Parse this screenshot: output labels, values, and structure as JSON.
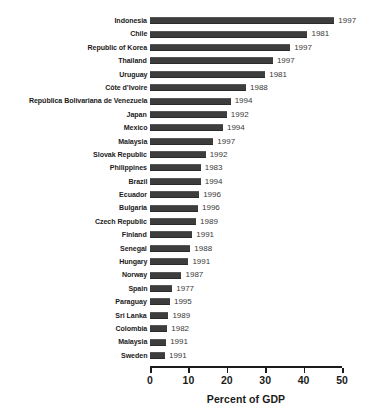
{
  "chart_data": {
    "type": "bar",
    "orientation": "horizontal",
    "title": "",
    "xlabel": "Percent of GDP",
    "ylabel": "",
    "xlim": [
      0,
      50
    ],
    "xticks": [
      0,
      10,
      20,
      30,
      40,
      50
    ],
    "xtick_labels": [
      "0",
      "10",
      "20",
      "30",
      "40",
      "50"
    ],
    "grid": false,
    "legend": null,
    "bar_color": "#3d3d3d",
    "axis_color": "#1b1b1b",
    "categories": [
      "Indonesia",
      "Chile",
      "Republic of Korea",
      "Thailand",
      "Uruguay",
      "Côte d’Ivoire",
      "República Bolivariana de Venezuela",
      "Japan",
      "Mexico",
      "Malaysia",
      "Slovak Republic",
      "Philippines",
      "Brazil",
      "Ecuador",
      "Bulgaria",
      "Czech Republic",
      "Finland",
      "Senegal",
      "Hungary",
      "Norway",
      "Spain",
      "Paraguay",
      "Sri Lanka",
      "Colombia",
      "Malaysia",
      "Sweden"
    ],
    "values": [
      48.0,
      41.0,
      36.5,
      32.0,
      30.0,
      25.0,
      21.0,
      20.0,
      19.0,
      16.5,
      14.5,
      13.2,
      13.2,
      12.8,
      12.5,
      12.0,
      11.0,
      10.5,
      10.0,
      8.2,
      5.8,
      5.2,
      4.8,
      4.5,
      4.2,
      3.9
    ],
    "annotations": [
      "1997",
      "1981",
      "1997",
      "1997",
      "1981",
      "1988",
      "1994",
      "1992",
      "1994",
      "1997",
      "1992",
      "1983",
      "1994",
      "1996",
      "1996",
      "1989",
      "1991",
      "1988",
      "1991",
      "1987",
      "1977",
      "1995",
      "1989",
      "1982",
      "1991",
      "1991"
    ]
  }
}
